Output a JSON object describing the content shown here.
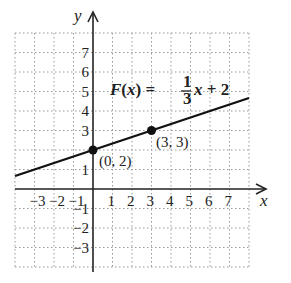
{
  "chart_data": {
    "type": "line",
    "title": "",
    "xlabel": "x",
    "ylabel": "y",
    "xlim": [
      -4,
      8
    ],
    "ylim": [
      -4,
      8
    ],
    "grid": true,
    "x_ticks": [
      "-3",
      "-2",
      "-1",
      "1",
      "2",
      "3",
      "4",
      "5",
      "6",
      "7"
    ],
    "y_ticks": [
      "7",
      "6",
      "5",
      "4",
      "3",
      "1",
      "-1",
      "-2",
      "-3"
    ],
    "series": [
      {
        "name": "F(x) = 1/3 x + 2",
        "slope": 0.3333,
        "intercept": 2,
        "x": [
          -4,
          8
        ],
        "y": [
          0.667,
          4.667
        ]
      }
    ],
    "points": [
      {
        "x": 0,
        "y": 2,
        "label": "(0, 2)"
      },
      {
        "x": 3,
        "y": 3,
        "label": "(3, 3)"
      }
    ],
    "annotation": {
      "fname": "F(x) = ",
      "numerator": "1",
      "denominator": "3",
      "rest": "x + 2"
    },
    "colors": {
      "line": "#111111",
      "grid": "#888888",
      "axis": "#222222"
    }
  }
}
